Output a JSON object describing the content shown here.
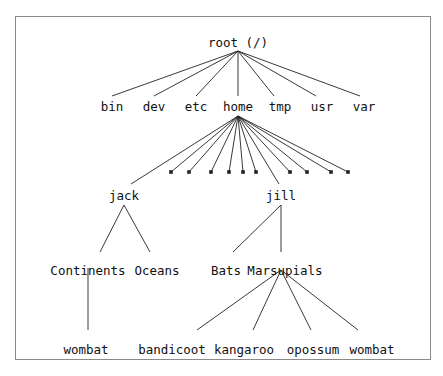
{
  "diagram": {
    "colors": {
      "border": "#8a8a8a",
      "line": "#222222",
      "text": "#111111"
    },
    "nodes": [
      {
        "id": "root",
        "label": "root (/)",
        "x": 238,
        "y": 47
      },
      {
        "id": "bin",
        "label": "bin",
        "x": 112,
        "y": 111
      },
      {
        "id": "dev",
        "label": "dev",
        "x": 154,
        "y": 111
      },
      {
        "id": "etc",
        "label": "etc",
        "x": 196,
        "y": 111
      },
      {
        "id": "home",
        "label": "home",
        "x": 238,
        "y": 111
      },
      {
        "id": "tmp",
        "label": "tmp",
        "x": 280,
        "y": 111
      },
      {
        "id": "usr",
        "label": "usr",
        "x": 322,
        "y": 111
      },
      {
        "id": "var",
        "label": "var",
        "x": 364,
        "y": 111
      },
      {
        "id": "jack",
        "label": "jack",
        "x": 124,
        "y": 200
      },
      {
        "id": "jill",
        "label": "jill",
        "x": 281,
        "y": 200
      },
      {
        "id": "continents",
        "label": "Continents",
        "x": 88,
        "y": 275
      },
      {
        "id": "oceans",
        "label": "Oceans",
        "x": 157,
        "y": 275
      },
      {
        "id": "bats",
        "label": "Bats",
        "x": 226,
        "y": 275
      },
      {
        "id": "marsupials",
        "label": "Marsupials",
        "x": 285,
        "y": 275
      },
      {
        "id": "wombat1",
        "label": "wombat",
        "x": 86,
        "y": 354
      },
      {
        "id": "bandicoot",
        "label": "bandicoot",
        "x": 172,
        "y": 354
      },
      {
        "id": "kangaroo",
        "label": "kangaroo",
        "x": 244,
        "y": 354
      },
      {
        "id": "opossum",
        "label": "opossum",
        "x": 313,
        "y": 354
      },
      {
        "id": "wombat2",
        "label": "wombat",
        "x": 372,
        "y": 354
      }
    ],
    "edges": [
      {
        "x1": 238,
        "y1": 51,
        "x2": 112,
        "y2": 96
      },
      {
        "x1": 238,
        "y1": 51,
        "x2": 154,
        "y2": 96
      },
      {
        "x1": 238,
        "y1": 51,
        "x2": 196,
        "y2": 96
      },
      {
        "x1": 238,
        "y1": 51,
        "x2": 238,
        "y2": 96
      },
      {
        "x1": 238,
        "y1": 51,
        "x2": 274,
        "y2": 96
      },
      {
        "x1": 238,
        "y1": 51,
        "x2": 316,
        "y2": 96
      },
      {
        "x1": 238,
        "y1": 51,
        "x2": 360,
        "y2": 96
      },
      {
        "x1": 238,
        "y1": 116,
        "x2": 131,
        "y2": 184
      },
      {
        "x1": 238,
        "y1": 116,
        "x2": 171,
        "y2": 172
      },
      {
        "x1": 238,
        "y1": 116,
        "x2": 189,
        "y2": 172
      },
      {
        "x1": 238,
        "y1": 116,
        "x2": 211,
        "y2": 172
      },
      {
        "x1": 238,
        "y1": 116,
        "x2": 229,
        "y2": 172
      },
      {
        "x1": 238,
        "y1": 116,
        "x2": 243,
        "y2": 172
      },
      {
        "x1": 238,
        "y1": 116,
        "x2": 256,
        "y2": 172
      },
      {
        "x1": 238,
        "y1": 116,
        "x2": 279,
        "y2": 184
      },
      {
        "x1": 238,
        "y1": 116,
        "x2": 290,
        "y2": 172
      },
      {
        "x1": 238,
        "y1": 116,
        "x2": 307,
        "y2": 172
      },
      {
        "x1": 238,
        "y1": 116,
        "x2": 331,
        "y2": 172
      },
      {
        "x1": 238,
        "y1": 116,
        "x2": 348,
        "y2": 172
      },
      {
        "x1": 124,
        "y1": 205,
        "x2": 100,
        "y2": 252
      },
      {
        "x1": 124,
        "y1": 205,
        "x2": 150,
        "y2": 252
      },
      {
        "x1": 281,
        "y1": 205,
        "x2": 233,
        "y2": 252
      },
      {
        "x1": 281,
        "y1": 205,
        "x2": 281,
        "y2": 252
      },
      {
        "x1": 88,
        "y1": 268,
        "x2": 88,
        "y2": 330
      },
      {
        "x1": 281,
        "y1": 270,
        "x2": 197,
        "y2": 330
      },
      {
        "x1": 281,
        "y1": 270,
        "x2": 253,
        "y2": 330
      },
      {
        "x1": 281,
        "y1": 270,
        "x2": 311,
        "y2": 330
      },
      {
        "x1": 281,
        "y1": 270,
        "x2": 358,
        "y2": 330
      }
    ],
    "stubs": [
      {
        "x": 171,
        "y": 172
      },
      {
        "x": 189,
        "y": 172
      },
      {
        "x": 211,
        "y": 172
      },
      {
        "x": 229,
        "y": 172
      },
      {
        "x": 243,
        "y": 172
      },
      {
        "x": 256,
        "y": 172
      },
      {
        "x": 290,
        "y": 172
      },
      {
        "x": 307,
        "y": 172
      },
      {
        "x": 331,
        "y": 172
      },
      {
        "x": 348,
        "y": 172
      }
    ]
  }
}
